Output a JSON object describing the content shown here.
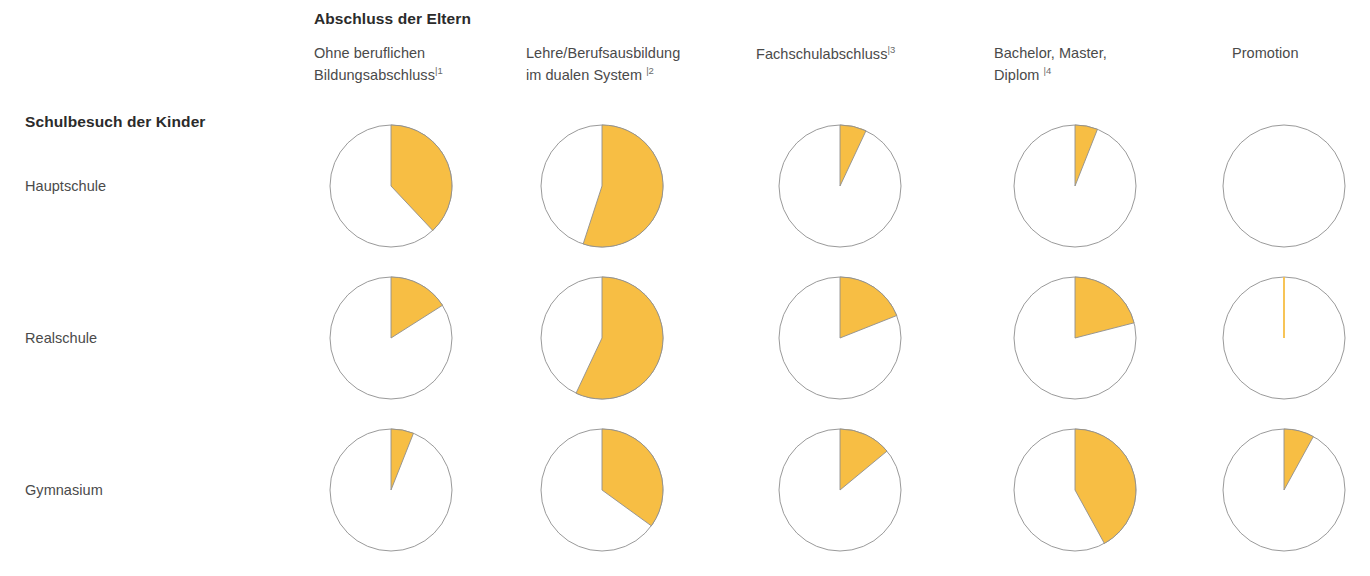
{
  "columns_group_label": "Abschluss der Eltern",
  "rows_group_label": "Schulbesuch der Kinder",
  "columns": [
    {
      "line1": "Ohne beruflichen",
      "line2": "Bildungsabschluss",
      "sup": "|1"
    },
    {
      "line1": "Lehre/Berufsausbildung",
      "line2": "im dualen System",
      "sup": "|2"
    },
    {
      "line1": "Fachschulabschluss",
      "line2": "",
      "sup": "|3"
    },
    {
      "line1": "Bachelor, Master,",
      "line2": "Diplom",
      "sup": "|4"
    },
    {
      "line1": "Promotion",
      "line2": "",
      "sup": ""
    }
  ],
  "rows": [
    {
      "label": "Hauptschule"
    },
    {
      "label": "Realschule"
    },
    {
      "label": "Gymnasium"
    }
  ],
  "colors": {
    "slice_fill": "#F7BE44",
    "slice_stroke": "#8f8f8f",
    "circle_stroke": "#9a9a9a",
    "background": "#ffffff",
    "text": "#4a4a4a",
    "heading_text": "#2b2b2b"
  },
  "chart_data": {
    "type": "pie",
    "xlabel": "Abschluss der Eltern",
    "ylabel": "Schulbesuch der Kinder",
    "legend": [],
    "grid": false,
    "unit": "percent",
    "categories": [
      "Ohne beruflichen Bildungsabschluss",
      "Lehre/Berufsausbildung im dualen System",
      "Fachschulabschluss",
      "Bachelor, Master, Diplom",
      "Promotion"
    ],
    "series": [
      {
        "name": "Hauptschule",
        "values": [
          38,
          55,
          7,
          6,
          0
        ]
      },
      {
        "name": "Realschule",
        "values": [
          16,
          57,
          19,
          21,
          1
        ]
      },
      {
        "name": "Gymnasium",
        "values": [
          6,
          35,
          14,
          42,
          8
        ]
      }
    ],
    "ylim": [
      0,
      100
    ]
  },
  "layout": {
    "pie_diameter": 124,
    "pie_centers_x": [
      391,
      602,
      840,
      1075,
      1284
    ],
    "pie_centers_y": [
      186,
      338,
      490
    ]
  }
}
